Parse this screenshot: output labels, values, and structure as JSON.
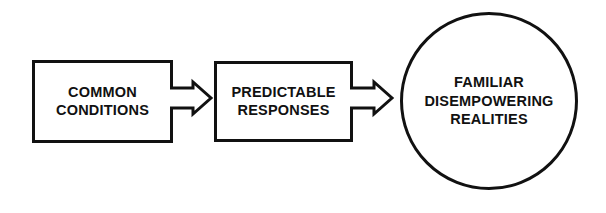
{
  "diagram": {
    "type": "flow-diagram",
    "background_color": "#ffffff",
    "stroke_color": "#111111",
    "nodes": [
      {
        "id": "common-conditions",
        "shape": "rectangle",
        "lines": [
          "COMMON",
          "CONDITIONS"
        ]
      },
      {
        "id": "predictable-responses",
        "shape": "rectangle",
        "lines": [
          "PREDICTABLE",
          "RESPONSES"
        ]
      },
      {
        "id": "familiar-disempowering-realities",
        "shape": "circle",
        "lines": [
          "FAMILIAR",
          "DISEMPOWERING",
          "REALITIES"
        ]
      }
    ],
    "connectors": [
      {
        "id": "conditions-to-responses",
        "icon": "block-arrow-right-icon",
        "from": "common-conditions",
        "to": "predictable-responses",
        "style": "hollow-block-arrow",
        "direction": "right"
      },
      {
        "id": "responses-to-realities",
        "icon": "block-arrow-right-icon",
        "from": "predictable-responses",
        "to": "familiar-disempowering-realities",
        "style": "hollow-block-arrow",
        "direction": "right"
      }
    ]
  }
}
